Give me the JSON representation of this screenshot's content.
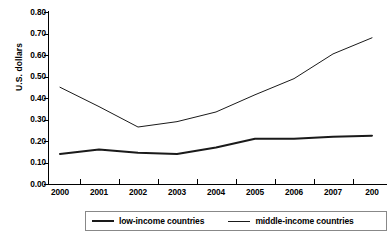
{
  "chart_data": {
    "type": "line",
    "title": "",
    "xlabel": "",
    "ylabel": "U.S. dollars",
    "ylim": [
      0.0,
      0.8
    ],
    "ytick_labels": [
      "0.80",
      "0.70",
      "0.60",
      "0.50",
      "0.40",
      "0.30",
      "0.20",
      "0.10",
      "0.00"
    ],
    "ytick_values": [
      0.8,
      0.7,
      0.6,
      0.5,
      0.4,
      0.3,
      0.2,
      0.1,
      0.0
    ],
    "grid": false,
    "legend_position": "bottom",
    "categories": [
      "2000",
      "2001",
      "2002",
      "2003",
      "2004",
      "2005",
      "2006",
      "2007",
      "2008"
    ],
    "xtick_labels_rendered": [
      "2000",
      "2001",
      "2002",
      "2003",
      "2004",
      "2005",
      "2006",
      "2007",
      "200"
    ],
    "series": [
      {
        "name": "low-income countries",
        "values": [
          0.14,
          0.16,
          0.145,
          0.14,
          0.17,
          0.21,
          0.21,
          0.22,
          0.225
        ],
        "color": "#1a1a1a",
        "line_width": 2
      },
      {
        "name": "middle-income countries",
        "values": [
          0.45,
          0.36,
          0.265,
          0.29,
          0.335,
          0.415,
          0.49,
          0.605,
          0.68
        ],
        "color": "#1a1a1a",
        "line_width": 1
      }
    ]
  },
  "axis": {
    "y_title": "U.S. dollars"
  },
  "legend": {
    "entries": [
      {
        "label": "low-income countries",
        "weight": "thick"
      },
      {
        "label": "middle-income countries",
        "weight": "thin"
      }
    ]
  }
}
